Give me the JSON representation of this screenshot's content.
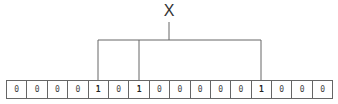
{
  "label": "X",
  "bits": [
    "0",
    "0",
    "0",
    "0",
    "1",
    "0",
    "1",
    "0",
    "0",
    "0",
    "0",
    "0",
    "1",
    "0",
    "0",
    "0"
  ],
  "hash_positions": [
    4,
    6,
    12
  ],
  "colors": {
    "line": "#666666",
    "text": "#333333"
  }
}
